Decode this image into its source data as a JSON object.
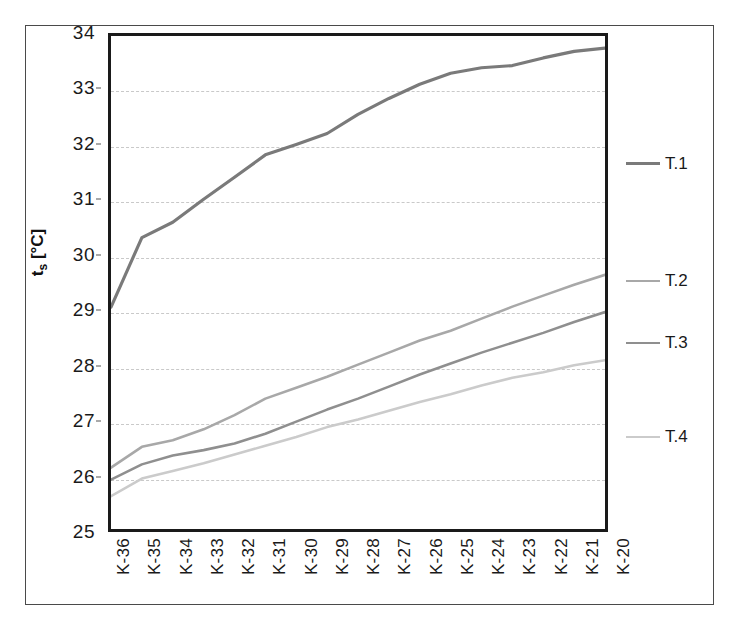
{
  "chart_data": {
    "type": "line",
    "title": "",
    "xlabel": "",
    "ylabel": "ts [°C]",
    "ylabel_main": "t",
    "ylabel_sub": "s",
    "ylabel_unit": " [°C]",
    "categories": [
      "K-36",
      "K-35",
      "K-34",
      "K-33",
      "K-32",
      "K-31",
      "K-30",
      "K-29",
      "K-28",
      "K-27",
      "K-26",
      "K-25",
      "K-24",
      "K-23",
      "K-22",
      "K-21",
      "K-20"
    ],
    "ylim": [
      25,
      34
    ],
    "yticks": [
      25,
      26,
      27,
      28,
      29,
      30,
      31,
      32,
      33,
      34
    ],
    "ytick_labels": [
      "25",
      "26",
      "27",
      "28",
      "29",
      "30",
      "31",
      "32",
      "33",
      "34"
    ],
    "grid": true,
    "grid_style": "horizontal-dashed",
    "legend_position": "right",
    "series": [
      {
        "name": "T.1",
        "color": "#7a7a7a",
        "width": 3.2,
        "values": [
          29.05,
          30.32,
          30.6,
          31.02,
          31.42,
          31.83,
          32.02,
          32.22,
          32.57,
          32.86,
          33.12,
          33.32,
          33.42,
          33.46,
          33.6,
          33.72,
          33.78
        ]
      },
      {
        "name": "T.2",
        "color": "#a8a8a8",
        "width": 2.6,
        "values": [
          26.12,
          26.5,
          26.62,
          26.82,
          27.08,
          27.38,
          27.58,
          27.78,
          28.0,
          28.22,
          28.44,
          28.62,
          28.84,
          29.06,
          29.26,
          29.46,
          29.64
        ]
      },
      {
        "name": "T.3",
        "color": "#8f8f8f",
        "width": 2.6,
        "values": [
          25.9,
          26.18,
          26.34,
          26.44,
          26.56,
          26.74,
          26.96,
          27.18,
          27.38,
          27.6,
          27.82,
          28.02,
          28.22,
          28.4,
          28.58,
          28.78,
          28.96
        ]
      },
      {
        "name": "T.4",
        "color": "#cbcbcb",
        "width": 2.6,
        "values": [
          25.6,
          25.92,
          26.06,
          26.2,
          26.36,
          26.52,
          26.68,
          26.86,
          27.0,
          27.16,
          27.32,
          27.46,
          27.62,
          27.76,
          27.86,
          27.99,
          28.08
        ]
      }
    ],
    "legend_y_values": [
      31.64,
      29.52,
      28.4,
      26.72
    ]
  },
  "colors": {
    "plot_border": "#1a1a1a",
    "outer_frame": "#4a4a4a",
    "gridline": "#c9c9c9",
    "background": "#ffffff",
    "text": "#1a1a1a"
  }
}
